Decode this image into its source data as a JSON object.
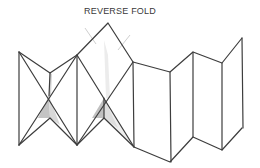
{
  "title": "REVERSE FOLD",
  "colors": {
    "line": "#3d3d3d",
    "shade": "#bdbdbd",
    "shade_light": "#dedede",
    "background": "#ffffff"
  },
  "diagram": {
    "panels": 7
  }
}
